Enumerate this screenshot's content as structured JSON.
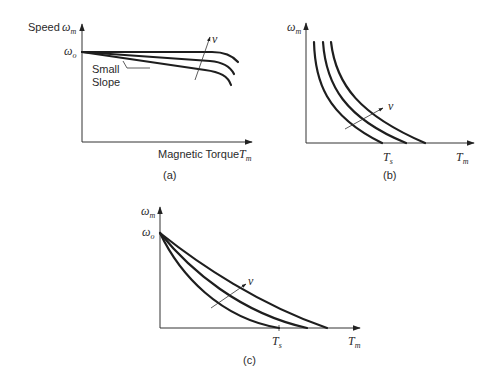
{
  "panels": [
    {
      "id": "a",
      "caption": "(a)",
      "y_axis_label": "Speed",
      "y_axis_symbol": "ω",
      "y_axis_sub": "m",
      "y0_symbol": "ω",
      "y0_sub": "o",
      "x_axis_label": "Magnetic Torque",
      "x_axis_symbol": "T",
      "x_axis_sub": "m",
      "annotation_line1": "Small",
      "annotation_line2": "Slope",
      "arrow_label": "v"
    },
    {
      "id": "b",
      "caption": "(b)",
      "y_axis_symbol": "ω",
      "y_axis_sub": "m",
      "x_axis_symbol": "T",
      "x_axis_sub": "m",
      "ts_symbol": "T",
      "ts_sub": "s",
      "arrow_label": "v"
    },
    {
      "id": "c",
      "caption": "(c)",
      "y_axis_symbol": "ω",
      "y_axis_sub": "m",
      "y0_symbol": "ω",
      "y0_sub": "o",
      "x_axis_symbol": "T",
      "x_axis_sub": "m",
      "ts_symbol": "T",
      "ts_sub": "s",
      "arrow_label": "v"
    }
  ]
}
